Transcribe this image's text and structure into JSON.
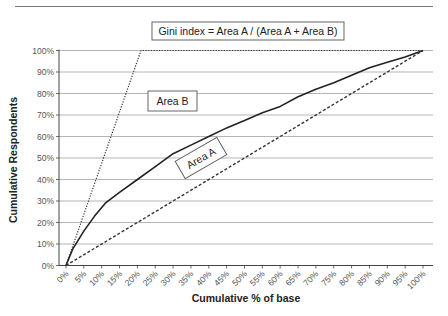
{
  "page": {
    "header_rule": true
  },
  "chart_data": {
    "type": "line",
    "title": "",
    "xlabel": "Cumulative % of base",
    "ylabel": "Cumulative Respondents",
    "xlim": [
      0,
      100
    ],
    "ylim": [
      0,
      100
    ],
    "grid": {
      "horizontal": true,
      "vertical": false
    },
    "x_ticks": [
      "0%",
      "5%",
      "10%",
      "15%",
      "20%",
      "25%",
      "30%",
      "35%",
      "40%",
      "45%",
      "50%",
      "55%",
      "60%",
      "65%",
      "70%",
      "75%",
      "80%",
      "85%",
      "90%",
      "95%",
      "100%"
    ],
    "y_ticks": [
      "0%",
      "10%",
      "20%",
      "30%",
      "40%",
      "50%",
      "60%",
      "70%",
      "80%",
      "90%",
      "100%"
    ],
    "series": [
      {
        "name": "Gains curve (model)",
        "style": "solid",
        "color": "#222222",
        "x": [
          0,
          2,
          5,
          8,
          11,
          15,
          20,
          25,
          30,
          35,
          40,
          45,
          50,
          55,
          60,
          65,
          70,
          75,
          80,
          85,
          90,
          95,
          100
        ],
        "y": [
          0,
          8,
          16,
          23,
          29,
          34,
          40,
          46,
          52,
          56,
          60,
          64,
          67.5,
          71,
          74,
          78.5,
          82,
          85,
          88.5,
          92,
          94.5,
          97,
          100
        ]
      },
      {
        "name": "Perfect model",
        "style": "dotted",
        "color": "#333333",
        "x": [
          0,
          21,
          100
        ],
        "y": [
          0,
          100,
          100
        ]
      },
      {
        "name": "Random (baseline)",
        "style": "dashed",
        "color": "#333333",
        "x": [
          0,
          100
        ],
        "y": [
          0,
          100
        ]
      }
    ],
    "annotations": [
      {
        "id": "gini",
        "text": "Gini index = Area A / (Area A + Area B)",
        "x": 152,
        "y": 22,
        "w": 192,
        "h": 18,
        "rotate": 0
      },
      {
        "id": "area_b",
        "text": "Area B",
        "x": 148,
        "y": 91,
        "w": 49,
        "h": 20,
        "rotate": 0
      },
      {
        "id": "area_a",
        "text": "Area A",
        "cx": 201,
        "cy": 158,
        "w": 48,
        "h": 20,
        "rotate": -30
      }
    ]
  }
}
